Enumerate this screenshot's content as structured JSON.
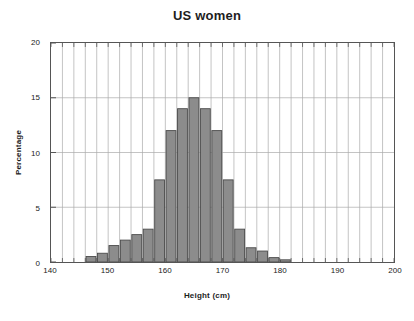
{
  "chart_data": {
    "type": "bar",
    "title": "US women",
    "xlabel": "Height (cm)",
    "ylabel": "Percentage",
    "xlim": [
      140,
      200
    ],
    "ylim": [
      0,
      20
    ],
    "bin_width": 2,
    "grid": true,
    "legend": null,
    "x_ticks": [
      140,
      150,
      160,
      170,
      180,
      190,
      200
    ],
    "x_minor_tick_step": 2,
    "y_ticks": [
      0,
      5,
      10,
      15,
      20
    ],
    "bar_color": "#8c8c8c",
    "bar_edge_color": "#4a4a4a",
    "grid_color": "#a9a9a9",
    "axis_color": "#555555",
    "bin_starts": [
      146,
      148,
      150,
      152,
      154,
      156,
      158,
      160,
      162,
      164,
      166,
      168,
      170,
      172,
      174,
      176,
      178,
      180
    ],
    "categories": [
      "146-148",
      "148-150",
      "150-152",
      "152-154",
      "154-156",
      "156-158",
      "158-160",
      "160-162",
      "162-164",
      "164-166",
      "166-168",
      "168-170",
      "170-172",
      "172-174",
      "174-176",
      "176-178",
      "178-180",
      "180-182"
    ],
    "values": [
      0.5,
      0.8,
      1.5,
      2.0,
      2.5,
      3.0,
      7.5,
      12.0,
      14.0,
      15.0,
      14.0,
      12.0,
      7.5,
      3.0,
      1.3,
      1.0,
      0.4,
      0.2
    ]
  }
}
